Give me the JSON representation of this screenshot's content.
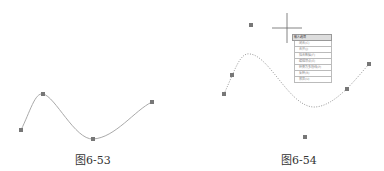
{
  "figures": [
    {
      "caption": "图6-53",
      "curve_style": "solid",
      "control_points": [
        [
          21,
          130
        ],
        [
          43,
          94
        ],
        [
          93,
          139
        ],
        [
          152,
          102
        ]
      ]
    },
    {
      "caption": "图6-54",
      "curve_style": "dotted",
      "control_points": [
        [
          251,
          25
        ],
        [
          224,
          94
        ],
        [
          232,
          75
        ],
        [
          347,
          89
        ],
        [
          369,
          64
        ],
        [
          305,
          137
        ]
      ],
      "crosshair": [
        287,
        28
      ],
      "menu": {
        "title": "输入选项",
        "items": [
          "闭合(C)",
          "合并(J)",
          "拟合数据(F)",
          "编辑顶点(E)",
          "转换为多段线(P)",
          "反转(R)",
          "放弃(U)"
        ]
      }
    }
  ],
  "colors": {
    "curve": "#999999",
    "point": "#777777",
    "crosshair": "#555555"
  }
}
